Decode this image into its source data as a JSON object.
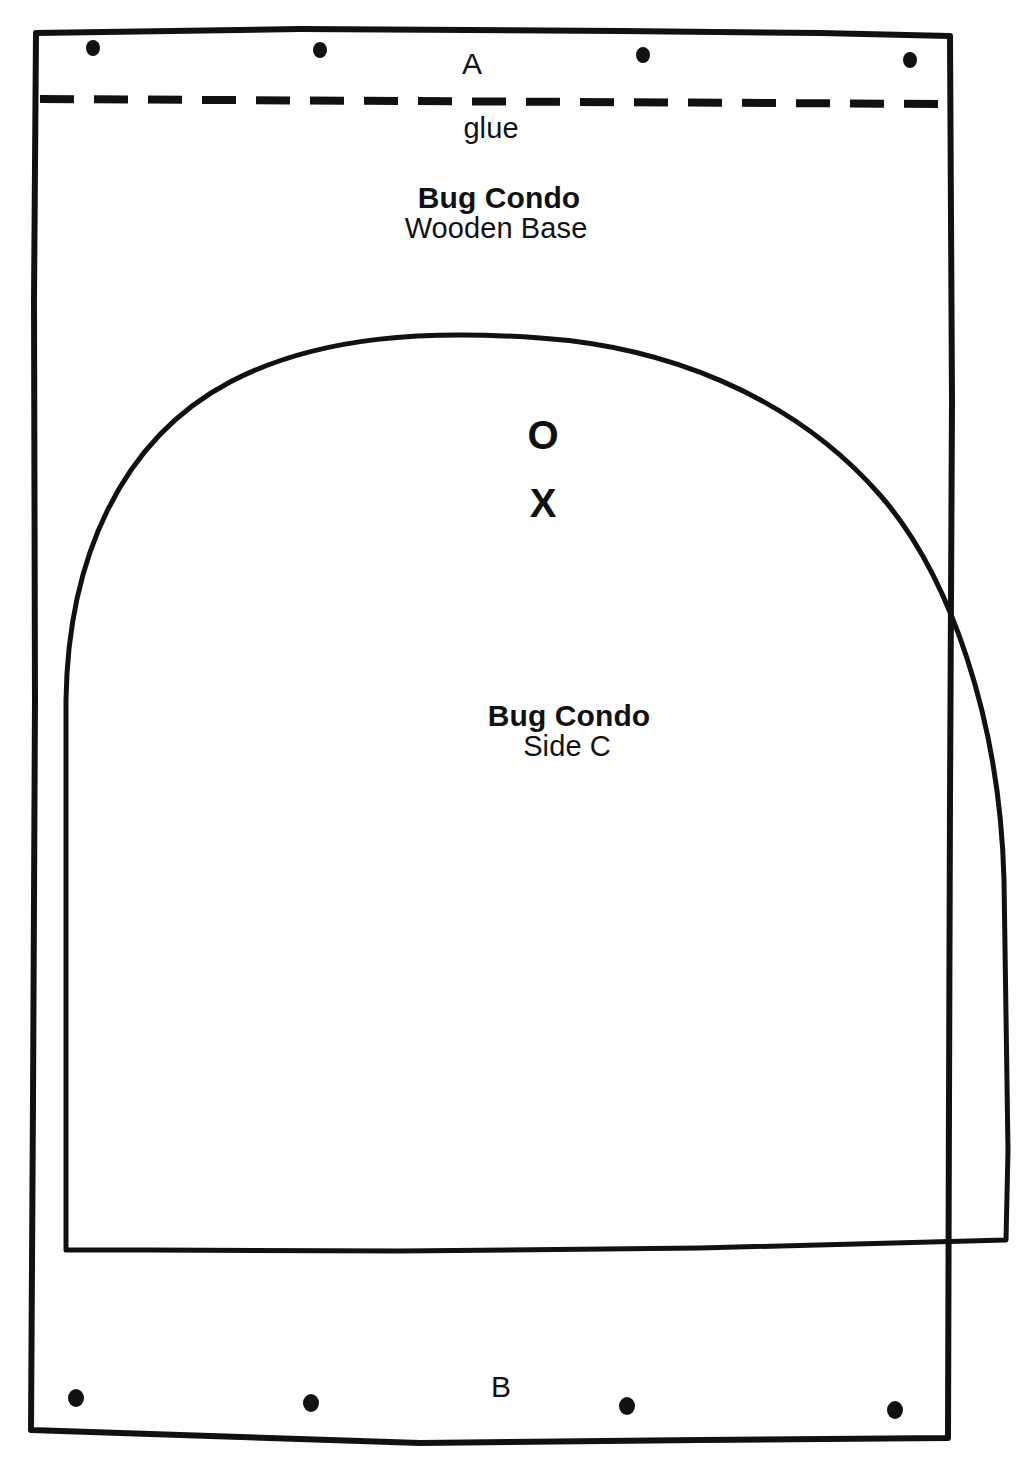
{
  "document": {
    "title": "Bug Condo",
    "sheet_background": "#ffffff",
    "ink_color": "#111111"
  },
  "labels": {
    "corner_a": "A",
    "corner_b": "B",
    "glue": "glue",
    "base_title": "Bug Condo",
    "base_subtitle": "Wooden Base",
    "side_title": "Bug Condo",
    "side_subtitle": "Side C"
  },
  "marks": {
    "circle": "O",
    "cross": "X"
  },
  "shapes": {
    "outer_rectangle": {
      "name": "wooden-base-outline",
      "stroke": "#111111",
      "stroke_width": 6
    },
    "glue_line": {
      "name": "glue-fold-line",
      "style": "dashed",
      "stroke": "#111111",
      "stroke_width": 7
    },
    "arch": {
      "name": "side-c-arch-outline",
      "stroke": "#111111",
      "stroke_width": 5
    }
  },
  "holes": {
    "top_row_label": "A",
    "bottom_row_label": "B",
    "top_count": 4,
    "bottom_count": 4
  }
}
